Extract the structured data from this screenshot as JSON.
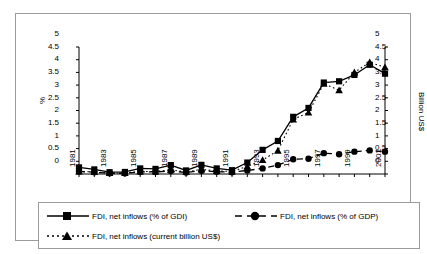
{
  "chart_data": {
    "type": "line",
    "title": "",
    "subtitle": "",
    "xlabel": "",
    "ylabel": "%",
    "y2label": "Billion US$",
    "ylim": [
      0,
      5
    ],
    "y2lim": [
      0,
      5
    ],
    "ytick_step": 0.5,
    "grid": false,
    "legend_position": "bottom",
    "x": [
      1981,
      1982,
      1983,
      1984,
      1985,
      1986,
      1987,
      1988,
      1989,
      1990,
      1991,
      1992,
      1993,
      1994,
      1995,
      1996,
      1997,
      1998,
      1999,
      2000,
      2001
    ],
    "xtick_labels": [
      "1981",
      "1983",
      "1985",
      "1987",
      "1989",
      "1991",
      "1993",
      "1995",
      "1997",
      "1999",
      "2001"
    ],
    "xtick_values": [
      1981,
      1983,
      1985,
      1987,
      1989,
      1991,
      1993,
      1995,
      1997,
      1999,
      2001
    ],
    "ytick_labels": [
      "0",
      "0.5",
      "1",
      "1.5",
      "2",
      "2.5",
      "3",
      "3.5",
      "4",
      "4.5",
      "5"
    ],
    "ytick_values": [
      0,
      0.5,
      1,
      1.5,
      2,
      2.5,
      3,
      3.5,
      4,
      4.5,
      5
    ],
    "y2tick_labels": [
      "0",
      "0.5",
      "1",
      "1.5",
      "2",
      "2.5",
      "3",
      "3.5",
      "4",
      "4.5",
      "5"
    ],
    "y2tick_values": [
      0,
      0.5,
      1,
      1.5,
      2,
      2.5,
      3,
      3.5,
      4,
      4.5,
      5
    ],
    "series": [
      {
        "name": "FDI, net inflows (% of GDI)",
        "marker": "square",
        "line_style": "solid",
        "color": "#000000",
        "axis": "left",
        "values": [
          0.26,
          0.18,
          0.07,
          0.08,
          0.22,
          0.2,
          0.35,
          0.14,
          0.36,
          0.22,
          0.15,
          0.45,
          0.95,
          1.3,
          2.25,
          2.6,
          3.6,
          3.65,
          3.9,
          4.3,
          3.95
        ]
      },
      {
        "name": "FDI, net inflows (% of GDP)",
        "marker": "circle",
        "line_style": "dashed",
        "color": "#000000",
        "axis": "left",
        "values": [
          0.1,
          0.07,
          0.03,
          0.03,
          0.08,
          0.08,
          0.12,
          0.06,
          0.13,
          0.09,
          0.07,
          0.14,
          0.22,
          0.35,
          0.58,
          0.6,
          0.82,
          0.78,
          0.88,
          0.93,
          0.88
        ]
      },
      {
        "name": "FDI, net inflows (current billion US$)",
        "marker": "triangle",
        "line_style": "dotted",
        "color": "#000000",
        "axis": "right",
        "values": [
          0.1,
          0.08,
          0.04,
          0.04,
          0.1,
          0.1,
          0.16,
          0.08,
          0.18,
          0.12,
          0.1,
          0.3,
          0.55,
          0.92,
          2.15,
          2.42,
          3.55,
          3.3,
          4.0,
          4.4,
          4.2
        ]
      }
    ]
  },
  "legend": {
    "items": [
      {
        "label": "FDI, net inflows (% of GDI)"
      },
      {
        "label": "FDI, net inflows (% of GDP)"
      },
      {
        "label": "FDI, net inflows (current billion US$)"
      }
    ]
  },
  "axes": {
    "left_title": "%",
    "right_title": "Billion US$"
  }
}
